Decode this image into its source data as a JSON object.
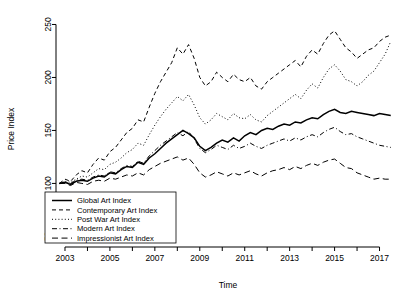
{
  "chart_data": {
    "type": "line",
    "title": "",
    "xlabel": "Time",
    "ylabel": "Price Index",
    "xlim": [
      2002.6,
      2017.6
    ],
    "ylim": [
      40,
      258
    ],
    "grid": false,
    "legend_position": "bottom-left",
    "y_ticks": [
      50,
      100,
      150,
      200,
      250
    ],
    "x_ticks": [
      2003,
      2004,
      2005,
      2006,
      2007,
      2008,
      2009,
      2010,
      2011,
      2012,
      2013,
      2014,
      2015,
      2016,
      2017
    ],
    "x_tick_labels": [
      "2003",
      "",
      "2005",
      "",
      "2007",
      "",
      "2009",
      "",
      "2011",
      "",
      "2013",
      "",
      "2015",
      "",
      "2017"
    ],
    "x": [
      2002.75,
      2003.0,
      2003.25,
      2003.5,
      2003.75,
      2004.0,
      2004.25,
      2004.5,
      2004.75,
      2005.0,
      2005.25,
      2005.5,
      2005.75,
      2006.0,
      2006.25,
      2006.5,
      2006.75,
      2007.0,
      2007.25,
      2007.5,
      2007.75,
      2008.0,
      2008.25,
      2008.5,
      2008.75,
      2009.0,
      2009.25,
      2009.5,
      2009.75,
      2010.0,
      2010.25,
      2010.5,
      2010.75,
      2011.0,
      2011.25,
      2011.5,
      2011.75,
      2012.0,
      2012.25,
      2012.5,
      2012.75,
      2013.0,
      2013.25,
      2013.5,
      2013.75,
      2014.0,
      2014.25,
      2014.5,
      2014.75,
      2015.0,
      2015.25,
      2015.5,
      2015.75,
      2016.0,
      2016.25,
      2016.5,
      2016.75,
      2017.0,
      2017.25,
      2017.5
    ],
    "series": [
      {
        "name": "Global Art Index",
        "style": "solid",
        "values": [
          100,
          101,
          99,
          102,
          103,
          102,
          105,
          107,
          106,
          110,
          109,
          113,
          116,
          115,
          120,
          118,
          124,
          128,
          133,
          138,
          142,
          146,
          150,
          147,
          143,
          135,
          131,
          134,
          138,
          141,
          139,
          143,
          140,
          145,
          148,
          146,
          150,
          152,
          151,
          154,
          156,
          155,
          158,
          157,
          160,
          162,
          161,
          165,
          168,
          170,
          167,
          166,
          168,
          167,
          166,
          165,
          164,
          166,
          165,
          164
        ]
      },
      {
        "name": "Contemporary Art Index",
        "style": "dashed",
        "values": [
          100,
          104,
          102,
          108,
          112,
          110,
          118,
          124,
          122,
          130,
          134,
          141,
          148,
          152,
          160,
          158,
          172,
          185,
          196,
          205,
          214,
          228,
          222,
          231,
          218,
          200,
          192,
          196,
          205,
          200,
          196,
          203,
          198,
          196,
          200,
          192,
          189,
          196,
          200,
          204,
          208,
          212,
          216,
          210,
          220,
          226,
          222,
          232,
          240,
          244,
          236,
          228,
          224,
          218,
          222,
          226,
          228,
          234,
          238,
          240
        ]
      },
      {
        "name": "Post War Art Index",
        "style": "dotted",
        "values": [
          100,
          102,
          101,
          104,
          107,
          106,
          110,
          114,
          113,
          118,
          120,
          124,
          129,
          132,
          138,
          136,
          146,
          155,
          163,
          170,
          176,
          182,
          178,
          184,
          174,
          162,
          156,
          160,
          166,
          163,
          160,
          166,
          162,
          161,
          165,
          160,
          158,
          164,
          168,
          172,
          176,
          180,
          184,
          180,
          188,
          194,
          190,
          200,
          208,
          212,
          206,
          198,
          196,
          192,
          196,
          202,
          206,
          214,
          222,
          234
        ]
      },
      {
        "name": "Modern Art Index",
        "style": "dashdot",
        "values": [
          100,
          101,
          100,
          103,
          104,
          103,
          106,
          108,
          107,
          111,
          110,
          114,
          117,
          116,
          121,
          119,
          126,
          131,
          136,
          140,
          144,
          148,
          145,
          149,
          142,
          133,
          129,
          132,
          136,
          134,
          132,
          136,
          133,
          135,
          138,
          135,
          133,
          136,
          138,
          140,
          142,
          140,
          143,
          141,
          144,
          146,
          144,
          148,
          151,
          153,
          149,
          146,
          147,
          144,
          142,
          140,
          138,
          136,
          135,
          134
        ]
      },
      {
        "name": "Impressionist Art Index",
        "style": "longdash",
        "values": [
          100,
          100,
          98,
          101,
          100,
          99,
          102,
          103,
          102,
          105,
          104,
          106,
          108,
          107,
          110,
          108,
          113,
          116,
          119,
          121,
          123,
          125,
          122,
          124,
          118,
          110,
          106,
          108,
          111,
          109,
          107,
          110,
          108,
          110,
          112,
          109,
          107,
          110,
          112,
          113,
          115,
          113,
          116,
          114,
          117,
          119,
          117,
          120,
          122,
          123,
          119,
          115,
          114,
          110,
          108,
          106,
          104,
          105,
          104,
          104
        ]
      }
    ]
  },
  "legend": {
    "items": [
      {
        "label": "Global Art Index",
        "style": "solid"
      },
      {
        "label": "Contemporary Art Index",
        "style": "dashed"
      },
      {
        "label": "Post War Art Index",
        "style": "dotted"
      },
      {
        "label": "Modern Art Index",
        "style": "dashdot"
      },
      {
        "label": "Impressionist Art Index",
        "style": "longdash"
      }
    ]
  }
}
